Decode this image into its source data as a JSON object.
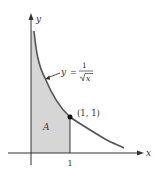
{
  "diagram": {
    "type": "area-under-curve",
    "function_label": {
      "lhs": "y",
      "eq": "=",
      "numerator": "1",
      "denominator": "x"
    },
    "point_label": "(1, 1)",
    "region_label": "A",
    "axes": {
      "x_label": "x",
      "y_label": "y"
    },
    "ticks": {
      "x": [
        "1"
      ]
    },
    "colors": {
      "curve": "#555555",
      "shade": "#d6d6d6",
      "axis": "#333333",
      "point": "#111111"
    }
  }
}
